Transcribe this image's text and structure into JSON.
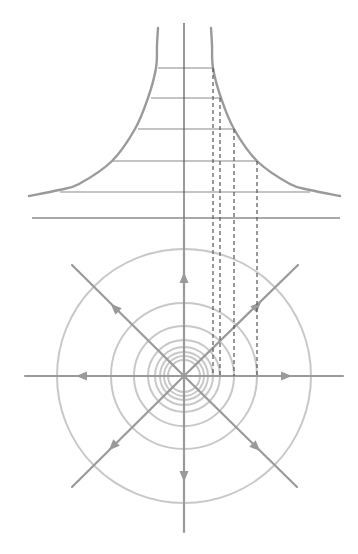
{
  "diagram": {
    "colors": {
      "curve": "#9a9a9a",
      "level_lines": "#c4c4c4",
      "axis": "#555555",
      "circles": "#c8c8c8",
      "field_lines": "#9a9a9a"
    },
    "top_plot": {
      "center_x": 184,
      "vertical_axis": {
        "x": 184,
        "y1": 23,
        "y2": 218
      },
      "horizontal_axis": {
        "x1": 32,
        "x2": 340,
        "y": 218
      },
      "right_curve_points": [
        [
          211,
          28
        ],
        [
          212,
          45
        ],
        [
          213,
          68
        ],
        [
          221,
          98
        ],
        [
          234,
          129
        ],
        [
          257,
          161
        ],
        [
          290,
          184
        ],
        [
          310,
          190
        ],
        [
          340,
          196
        ]
      ],
      "left_curve_points": [
        [
          158,
          28
        ],
        [
          157,
          45
        ],
        [
          156,
          68
        ],
        [
          148,
          98
        ],
        [
          135,
          129
        ],
        [
          112,
          161
        ],
        [
          79,
          184
        ],
        [
          59,
          190
        ],
        [
          29,
          196
        ]
      ],
      "level_lines": [
        {
          "y": 68,
          "x1": 158,
          "x2": 213
        },
        {
          "y": 98,
          "x1": 151,
          "x2": 221
        },
        {
          "y": 129,
          "x1": 138,
          "x2": 234
        },
        {
          "y": 161,
          "x1": 113,
          "x2": 257
        },
        {
          "y": 192,
          "x1": 60,
          "x2": 310
        }
      ],
      "projection_lines": [
        {
          "x": 213,
          "y1": 68,
          "y2": 376
        },
        {
          "x": 220,
          "y1": 98,
          "y2": 376
        },
        {
          "x": 234,
          "y1": 129,
          "y2": 376
        },
        {
          "x": 257,
          "y1": 161,
          "y2": 376
        }
      ]
    },
    "bottom_plot": {
      "center": {
        "x": 184,
        "y": 376
      },
      "circle_radii": [
        127,
        73,
        50,
        36,
        29,
        24,
        20,
        16
      ],
      "field_lines": [
        {
          "name": "up",
          "x1": 184,
          "y1": 376,
          "x2": 184,
          "y2": 219,
          "arrow": {
            "x": 184,
            "y": 278,
            "angle": -90
          }
        },
        {
          "name": "down",
          "x1": 184,
          "y1": 376,
          "x2": 184,
          "y2": 532,
          "arrow": {
            "x": 184,
            "y": 476,
            "angle": 90
          }
        },
        {
          "name": "left",
          "x1": 184,
          "y1": 376,
          "x2": 25,
          "y2": 376,
          "arrow": {
            "x": 82,
            "y": 376,
            "angle": 180
          }
        },
        {
          "name": "right",
          "x1": 184,
          "y1": 376,
          "x2": 343,
          "y2": 376,
          "arrow": {
            "x": 286,
            "y": 376,
            "angle": 0
          }
        },
        {
          "name": "up-left",
          "x1": 184,
          "y1": 376,
          "x2": 72,
          "y2": 265,
          "arrow": {
            "x": 115,
            "y": 308,
            "angle": -135
          }
        },
        {
          "name": "up-right",
          "x1": 184,
          "y1": 376,
          "x2": 298,
          "y2": 265,
          "arrow": {
            "x": 257,
            "y": 306,
            "angle": -45
          }
        },
        {
          "name": "down-left",
          "x1": 184,
          "y1": 376,
          "x2": 72,
          "y2": 487,
          "arrow": {
            "x": 113,
            "y": 446,
            "angle": 135
          }
        },
        {
          "name": "down-right",
          "x1": 184,
          "y1": 376,
          "x2": 297,
          "y2": 487,
          "arrow": {
            "x": 256,
            "y": 447,
            "angle": 45
          }
        }
      ]
    }
  }
}
